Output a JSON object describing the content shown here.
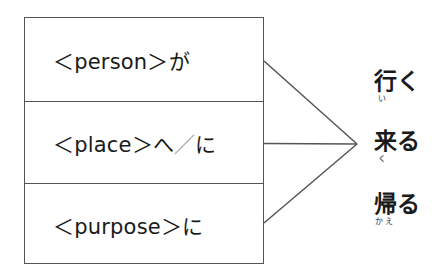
{
  "diagram": {
    "type": "sentence-pattern",
    "colors": {
      "line": "#555555",
      "text": "#1a1a1a",
      "slash": "#8a8a8a"
    },
    "slots": [
      {
        "placeholder": "<person>",
        "particle": "が",
        "display": "＜person＞が"
      },
      {
        "placeholder": "<place>",
        "particle": "へ／に",
        "display_main": "＜place＞へ",
        "display_slash": "／",
        "display_tail": "に"
      },
      {
        "placeholder": "<purpose>",
        "particle": "に",
        "display": "＜purpose＞に"
      }
    ],
    "verbs": [
      {
        "word": "行く",
        "kanji": "行",
        "okurigana": "く",
        "reading": "い"
      },
      {
        "word": "来る",
        "kanji": "来",
        "okurigana": "る",
        "reading": "く"
      },
      {
        "word": "帰る",
        "kanji": "帰",
        "okurigana": "る",
        "reading": "かえ"
      }
    ],
    "connectors": [
      {
        "from": "slot-0",
        "to": "verbs"
      },
      {
        "from": "slot-1",
        "to": "verbs"
      },
      {
        "from": "slot-2",
        "to": "verbs"
      }
    ]
  }
}
